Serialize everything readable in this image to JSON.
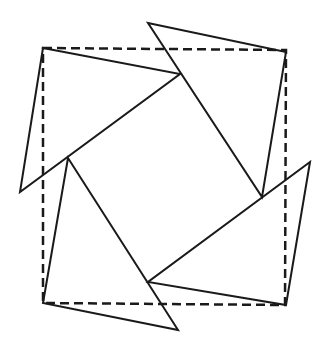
{
  "diagram": {
    "title": "",
    "stroke_color": "#1a1a1a",
    "dashed_square": {
      "points": [
        [
          43,
          48
        ],
        [
          286,
          50
        ],
        [
          285,
          305
        ],
        [
          43,
          303
        ]
      ]
    },
    "triangles": [
      {
        "name": "top-left",
        "points": [
          [
            43,
            48
          ],
          [
            180,
            74
          ],
          [
            20,
            192
          ]
        ]
      },
      {
        "name": "top-right",
        "points": [
          [
            148,
            23
          ],
          [
            286,
            52
          ],
          [
            262,
            197
          ]
        ]
      },
      {
        "name": "bottom-right",
        "points": [
          [
            310,
            162
          ],
          [
            286,
            305
          ],
          [
            148,
            282
          ]
        ]
      },
      {
        "name": "bottom-left",
        "points": [
          [
            68,
            158
          ],
          [
            178,
            330
          ],
          [
            43,
            303
          ]
        ]
      }
    ]
  }
}
